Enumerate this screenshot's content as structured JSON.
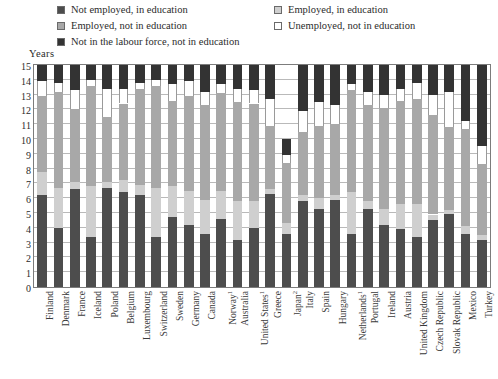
{
  "legend": {
    "left_items": [
      {
        "label": "Not employed, in education",
        "color": "#4d4d4d",
        "key": "not_employed_in_education"
      },
      {
        "label": "Employed, not in education",
        "color": "#a8a8a8",
        "key": "employed_not_in_education"
      },
      {
        "label": "Not in the labour force, not in education",
        "color": "#333333",
        "key": "not_in_labour_force_not_in_education"
      }
    ],
    "right_items": [
      {
        "label": "Employed, in education",
        "color": "#cfcfcf",
        "key": "employed_in_education"
      },
      {
        "label": "Unemployed, not in education",
        "color": "#ffffff",
        "key": "unemployed_not_in_education"
      }
    ]
  },
  "chart_data": {
    "type": "bar",
    "title": "",
    "subtitle": "",
    "xlabel": "",
    "ylabel": "Years",
    "ylim": [
      0,
      15
    ],
    "yticks": [
      0,
      1,
      2,
      3,
      4,
      5,
      6,
      7,
      8,
      9,
      10,
      11,
      12,
      13,
      14,
      15
    ],
    "grid": true,
    "stacked": true,
    "legend_position": "top",
    "series_order_bottom_to_top": [
      "not_employed_in_education",
      "employed_in_education",
      "employed_not_in_education",
      "unemployed_not_in_education",
      "not_in_labour_force_not_in_education"
    ],
    "colors": {
      "not_employed_in_education": "#4d4d4d",
      "employed_in_education": "#cfcfcf",
      "employed_not_in_education": "#a8a8a8",
      "unemployed_not_in_education": "#ffffff",
      "not_in_labour_force_not_in_education": "#333333"
    },
    "categories": [
      "Finland",
      "Denmark",
      "France",
      "Iceland",
      "Poland",
      "Belgium",
      "Luxembourg",
      "Switzerland",
      "Sweden",
      "Germany",
      "Canada",
      "Norway",
      "Australia",
      "United States",
      "Greece",
      "Japan",
      "Italy",
      "Spain",
      "Hungary",
      "Netherlands",
      "Portugal",
      "Ireland",
      "Austria",
      "United Kingdom",
      "Czech Republic",
      "Slovak Republic",
      "Mexico",
      "Turkey"
    ],
    "category_notes": {
      "Norway": "1",
      "United States": "1",
      "Japan": "2",
      "Netherlands": "1"
    },
    "series": [
      {
        "name": "Not employed, in education",
        "values": [
          6.2,
          4.0,
          6.6,
          3.4,
          6.7,
          6.4,
          6.2,
          3.4,
          4.7,
          4.2,
          3.6,
          4.6,
          3.2,
          4.0,
          6.3,
          3.6,
          5.8,
          5.3,
          5.9,
          3.6,
          5.3,
          4.2,
          3.9,
          3.4,
          4.5,
          4.9,
          3.6,
          3.2
        ]
      },
      {
        "name": "Employed, in education",
        "values": [
          1.6,
          2.7,
          0.5,
          3.4,
          0.4,
          0.8,
          0.7,
          3.3,
          2.1,
          2.3,
          2.3,
          1.9,
          2.6,
          1.8,
          0.3,
          0.7,
          0.4,
          0.7,
          0.3,
          2.8,
          0.5,
          1.1,
          1.7,
          2.2,
          0.4,
          0.3,
          0.5,
          0.3
        ]
      },
      {
        "name": "Employed, not in education",
        "values": [
          5.1,
          6.5,
          4.9,
          6.8,
          4.4,
          5.2,
          6.5,
          6.9,
          5.8,
          6.4,
          6.4,
          6.6,
          6.7,
          6.6,
          4.3,
          4.1,
          4.3,
          4.9,
          4.8,
          6.9,
          6.5,
          6.8,
          7.0,
          7.1,
          6.7,
          5.6,
          6.6,
          4.8
        ]
      },
      {
        "name": "Unemployed, not in education",
        "values": [
          1.0,
          0.6,
          1.3,
          0.4,
          1.9,
          1.0,
          0.4,
          0.4,
          1.1,
          1.0,
          0.9,
          0.6,
          0.9,
          0.9,
          1.8,
          0.5,
          1.4,
          1.6,
          1.3,
          0.4,
          0.9,
          0.9,
          0.8,
          1.1,
          1.4,
          2.4,
          0.5,
          1.2
        ]
      },
      {
        "name": "Not in the labour force, not in education",
        "values": [
          1.1,
          1.2,
          1.7,
          1.0,
          1.6,
          1.6,
          1.2,
          1.0,
          1.3,
          1.1,
          1.8,
          1.3,
          1.6,
          1.7,
          2.3,
          1.1,
          3.1,
          2.5,
          2.7,
          1.3,
          1.8,
          2.0,
          1.6,
          1.2,
          2.0,
          1.8,
          3.8,
          5.5
        ]
      }
    ]
  }
}
